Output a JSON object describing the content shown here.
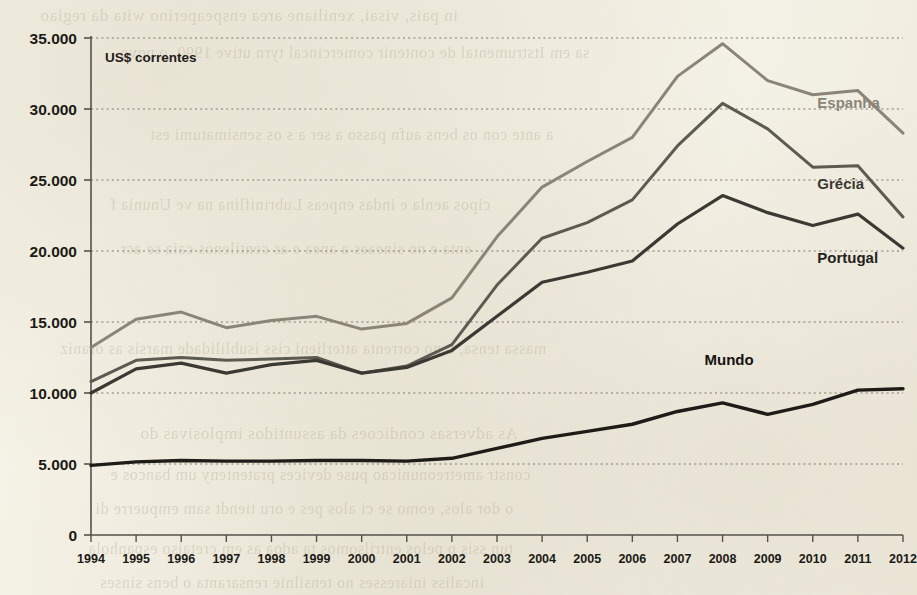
{
  "figure": {
    "unit_note": "US$ correntes",
    "background_color": "#f3f0e4",
    "ink_color": "#1c1a16"
  },
  "bleed_through": [
    {
      "text": "in pais, visai, xeniliane area enspeaperino wita da regiao",
      "x": 40,
      "y": 6,
      "size": 17
    },
    {
      "text": "sa em Itstrumental de contenir comercincal tyrn utive 1990, o povo",
      "x": 120,
      "y": 44,
      "size": 16
    },
    {
      "text": "a ante con os bens aufn passo a ser a s os sensimatumi est",
      "x": 150,
      "y": 126,
      "size": 16
    },
    {
      "text": "cipos aenla e indas enpeas Lubriniflina na ve Ununia f",
      "x": 110,
      "y": 196,
      "size": 16
    },
    {
      "text": "enta e no sineaes a anea e as centilenos caia se acr",
      "x": 120,
      "y": 240,
      "size": 16
    },
    {
      "text": "massa tensa, o no correnta atterlieni ciss isublilidade marsis as oraniz",
      "x": 60,
      "y": 340,
      "size": 16
    },
    {
      "text": "As adversas condicoes da assuntidos implosivas do",
      "x": 140,
      "y": 424,
      "size": 17
    },
    {
      "text": "constr ametreonunicao puse devices pratenteny um bancos e",
      "x": 110,
      "y": 466,
      "size": 16
    },
    {
      "text": "o dor alos, eomo se ci alos pes e oru tiendt sam empuerre di",
      "x": 95,
      "y": 500,
      "size": 16
    },
    {
      "text": "tun ssis p pelos entrilsomos ta adoa as em cretaiso espanhola",
      "x": 88,
      "y": 540,
      "size": 16
    },
    {
      "text": "incaliss iniaresses no tensilnie rensaranta o bens sinses",
      "x": 100,
      "y": 574,
      "size": 16
    }
  ],
  "chart_data": {
    "type": "line",
    "title": "",
    "xlabel": "",
    "ylabel": "US$ correntes",
    "ylim": [
      0,
      35000
    ],
    "ytick_step": 5000,
    "ytick_labels": [
      "0",
      "5.000",
      "10.000",
      "15.000",
      "20.000",
      "25.000",
      "30.000",
      "35.000"
    ],
    "grid": true,
    "grid_style": "dotted",
    "legend_position": "inline-right-of-series",
    "x": [
      1994,
      1995,
      1996,
      1997,
      1998,
      1999,
      2000,
      2001,
      2002,
      2003,
      2004,
      2005,
      2006,
      2007,
      2008,
      2009,
      2010,
      2011,
      2012
    ],
    "series": [
      {
        "name": "Espanha",
        "color": "#8a8578",
        "label_color": "#8a8578",
        "width": 3.0,
        "values": [
          13200,
          15200,
          15700,
          14600,
          15100,
          15400,
          14500,
          14900,
          16700,
          21000,
          24500,
          26300,
          28000,
          32300,
          34600,
          32000,
          31000,
          31300,
          28300
        ],
        "label_x": 2010.1,
        "label_y": 30050
      },
      {
        "name": "Grécia",
        "color": "#5d5a51",
        "label_color": "#3a3832",
        "width": 3.0,
        "values": [
          10800,
          12300,
          12500,
          12300,
          12400,
          12500,
          11400,
          11900,
          13400,
          17600,
          20900,
          22000,
          23600,
          27400,
          30400,
          28600,
          25900,
          26000,
          22400
        ],
        "label_x": 2010.1,
        "label_y": 24400
      },
      {
        "name": "Portugal",
        "color": "#3b3933",
        "label_color": "#24221d",
        "width": 3.2,
        "values": [
          10000,
          11700,
          12100,
          11400,
          12000,
          12300,
          11400,
          11800,
          13000,
          15400,
          17800,
          18500,
          19300,
          21900,
          23900,
          22700,
          21800,
          22600,
          20200
        ],
        "label_x": 2010.1,
        "label_y": 19150
      },
      {
        "name": "Mundo",
        "color": "#1e1c18",
        "label_color": "#15130f",
        "width": 3.4,
        "values": [
          4900,
          5150,
          5250,
          5200,
          5200,
          5250,
          5250,
          5200,
          5400,
          6100,
          6800,
          7300,
          7800,
          8700,
          9300,
          8500,
          9200,
          10200,
          10300
        ],
        "label_x": 2007.6,
        "label_y": 12000
      }
    ]
  }
}
